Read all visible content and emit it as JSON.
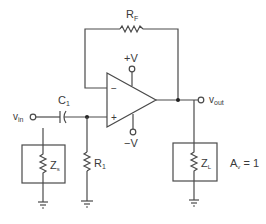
{
  "diagram": {
    "type": "op-amp voltage follower circuit",
    "labels": {
      "feedback_resistor": "R",
      "feedback_resistor_sub": "F",
      "pos_supply": "+V",
      "neg_supply": "−V",
      "inverting_input": "−",
      "noninverting_input": "+",
      "capacitor": "C",
      "capacitor_sub": "1",
      "input": "v",
      "input_sub": "in",
      "output": "v",
      "output_sub": "out",
      "input_resistor": "R",
      "input_resistor_sub": "1",
      "source_impedance": "Z",
      "source_impedance_sub": "s",
      "load_impedance": "Z",
      "load_impedance_sub": "L",
      "gain": "A",
      "gain_sub": "v",
      "gain_value": " = 1"
    },
    "colors": {
      "line": "#4a4a4a",
      "text": "#3a3a3a",
      "background": "#ffffff"
    }
  }
}
